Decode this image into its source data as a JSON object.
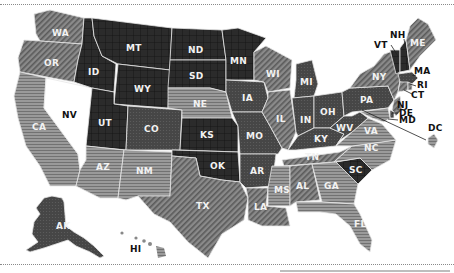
{
  "map": {
    "title": "",
    "legend_categories": [
      {
        "id": "cat1",
        "pattern": "dark-grid",
        "fill": "#2c2c2c"
      },
      {
        "id": "cat2",
        "pattern": "dark-dots",
        "fill": "#444444"
      },
      {
        "id": "cat3",
        "pattern": "diagonal-stripes",
        "fill": "#7a7a7a"
      },
      {
        "id": "cat4",
        "pattern": "horizontal-stripes",
        "fill": "#8e8e8e"
      },
      {
        "id": "cat5",
        "pattern": "none",
        "fill": "#ffffff"
      }
    ],
    "states": {
      "WA": {
        "label": "WA",
        "category": "cat3"
      },
      "OR": {
        "label": "OR",
        "category": "cat3"
      },
      "CA": {
        "label": "CA",
        "category": "cat4"
      },
      "NV": {
        "label": "NV",
        "category": "cat5"
      },
      "ID": {
        "label": "ID",
        "category": "cat1"
      },
      "MT": {
        "label": "MT",
        "category": "cat1"
      },
      "WY": {
        "label": "WY",
        "category": "cat1"
      },
      "UT": {
        "label": "UT",
        "category": "cat1"
      },
      "CO": {
        "label": "CO",
        "category": "cat2"
      },
      "AZ": {
        "label": "AZ",
        "category": "cat4"
      },
      "NM": {
        "label": "NM",
        "category": "cat4"
      },
      "ND": {
        "label": "ND",
        "category": "cat1"
      },
      "SD": {
        "label": "SD",
        "category": "cat1"
      },
      "NE": {
        "label": "NE",
        "category": "cat4"
      },
      "KS": {
        "label": "KS",
        "category": "cat1"
      },
      "OK": {
        "label": "OK",
        "category": "cat1"
      },
      "TX": {
        "label": "TX",
        "category": "cat3"
      },
      "MN": {
        "label": "MN",
        "category": "cat1"
      },
      "IA": {
        "label": "IA",
        "category": "cat2"
      },
      "MO": {
        "label": "MO",
        "category": "cat2"
      },
      "AR": {
        "label": "AR",
        "category": "cat2"
      },
      "LA": {
        "label": "LA",
        "category": "cat3"
      },
      "WI": {
        "label": "WI",
        "category": "cat3"
      },
      "IL": {
        "label": "IL",
        "category": "cat3"
      },
      "MI": {
        "label": "MI",
        "category": "cat2"
      },
      "IN": {
        "label": "IN",
        "category": "cat2"
      },
      "OH": {
        "label": "OH",
        "category": "cat2"
      },
      "KY": {
        "label": "KY",
        "category": "cat2"
      },
      "TN": {
        "label": "TN",
        "category": "cat3"
      },
      "MS": {
        "label": "MS",
        "category": "cat4"
      },
      "AL": {
        "label": "AL",
        "category": "cat3"
      },
      "GA": {
        "label": "GA",
        "category": "cat4"
      },
      "FL": {
        "label": "FL",
        "category": "cat4"
      },
      "SC": {
        "label": "SC",
        "category": "cat1"
      },
      "NC": {
        "label": "NC",
        "category": "cat4"
      },
      "VA": {
        "label": "VA",
        "category": "cat4"
      },
      "WV": {
        "label": "WV",
        "category": "cat2"
      },
      "PA": {
        "label": "PA",
        "category": "cat2"
      },
      "NY": {
        "label": "NY",
        "category": "cat3"
      },
      "VT": {
        "label": "VT",
        "category": "cat1"
      },
      "NH": {
        "label": "NH",
        "category": "cat1"
      },
      "ME": {
        "label": "ME",
        "category": "cat3"
      },
      "MA": {
        "label": "MA",
        "category": "cat2"
      },
      "RI": {
        "label": "RI",
        "category": "cat3"
      },
      "CT": {
        "label": "CT",
        "category": "cat3"
      },
      "NJ": {
        "label": "NJ",
        "category": "cat3"
      },
      "DE": {
        "label": "DE",
        "category": "cat2"
      },
      "MD": {
        "label": "MD",
        "category": "cat4"
      },
      "DC": {
        "label": "DC",
        "category": "cat4"
      },
      "AK": {
        "label": "AK",
        "category": "cat2"
      },
      "HI": {
        "label": "HI",
        "category": "cat4"
      }
    }
  }
}
